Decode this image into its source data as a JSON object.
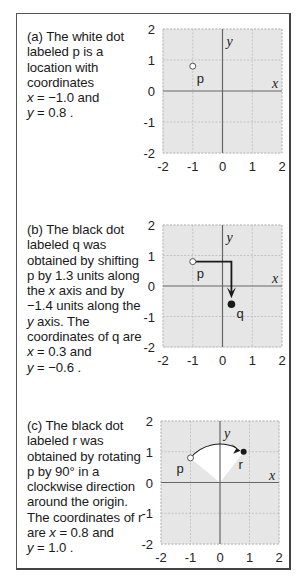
{
  "panels": [
    {
      "id": "a",
      "text_lines": [
        "(a) The white dot",
        "labeled p is a",
        "location with",
        "coordinates"
      ],
      "coord_x_line": {
        "var": "x",
        "rest": " = −1.0 and"
      },
      "coord_y_line": {
        "var": "y",
        "rest": " = 0.8 ."
      }
    },
    {
      "id": "b",
      "text_lines": [
        "(b) The black dot",
        "labeled q was",
        "obtained by shifting",
        "p by 1.3 units along"
      ],
      "line5": {
        "pre": "the ",
        "var": "x",
        "post": " axis and by"
      },
      "line6": "−1.4 units along the",
      "line7": {
        "var": "y",
        "post": " axis. The"
      },
      "line8": "coordinates of q are",
      "coord_x_line": {
        "var": "x",
        "rest": " = 0.3 and"
      },
      "coord_y_line": {
        "var": "y",
        "rest": " = −0.6 ."
      }
    },
    {
      "id": "c",
      "text_lines": [
        "(c) The black dot",
        "labeled r was",
        "obtained by rotating",
        "p by 90° in a",
        "clockwise direction",
        "around the origin.",
        "The coordinates of r"
      ],
      "line8": {
        "pre": "are ",
        "var": "x",
        "post": " = 0.8 and"
      },
      "coord_y_line": {
        "var": "y",
        "rest": " = 1.0 ."
      }
    }
  ],
  "chart_data": [
    {
      "type": "scatter",
      "panel": "a",
      "xlim": [
        -2,
        2
      ],
      "ylim": [
        -2,
        2
      ],
      "xticks": [
        "-2",
        "-1",
        "0",
        "1",
        "2"
      ],
      "yticks": [
        "2",
        "1",
        "0",
        "-1",
        "-2"
      ],
      "xlabel": "x",
      "ylabel": "y",
      "grid": true,
      "points": [
        {
          "label": "p",
          "x": -1.0,
          "y": 0.8,
          "style": "white"
        }
      ]
    },
    {
      "type": "scatter",
      "panel": "b",
      "xlim": [
        -2,
        2
      ],
      "ylim": [
        -2,
        2
      ],
      "xticks": [
        "-2",
        "-1",
        "0",
        "1",
        "2"
      ],
      "yticks": [
        "2",
        "1",
        "0",
        "-1",
        "-2"
      ],
      "xlabel": "x",
      "ylabel": "y",
      "grid": true,
      "points": [
        {
          "label": "p",
          "x": -1.0,
          "y": 0.8,
          "style": "white"
        },
        {
          "label": "q",
          "x": 0.3,
          "y": -0.6,
          "style": "black"
        }
      ],
      "annotation": {
        "kind": "shift-arrow",
        "dx": 1.3,
        "dy": -1.4
      }
    },
    {
      "type": "scatter",
      "panel": "c",
      "xlim": [
        -2,
        2
      ],
      "ylim": [
        -2,
        2
      ],
      "xticks": [
        "-2",
        "-1",
        "0",
        "1",
        "2"
      ],
      "yticks": [
        "2",
        "1",
        "0",
        "-1",
        "-2"
      ],
      "xlabel": "x",
      "ylabel": "y",
      "grid": true,
      "points": [
        {
          "label": "p",
          "x": -1.0,
          "y": 0.8,
          "style": "white"
        },
        {
          "label": "r",
          "x": 0.8,
          "y": 1.0,
          "style": "black"
        }
      ],
      "annotation": {
        "kind": "rotation-arc",
        "angle_deg": 90,
        "direction": "clockwise",
        "center": [
          0,
          0
        ]
      }
    }
  ],
  "colors": {
    "plot_bg": "#e6e6e6",
    "grid": "#c4c4c4",
    "axis": "#666666",
    "wedge": "#ffffff",
    "ink": "#1a1a1a"
  }
}
